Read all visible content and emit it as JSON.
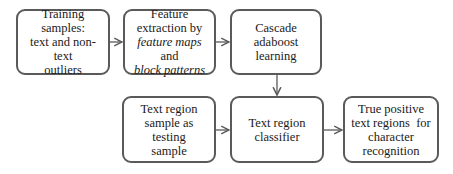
{
  "diagram": {
    "nodes": [
      {
        "id": "training",
        "lines": [
          "Training samples:",
          "text and non-text",
          "outliers"
        ]
      },
      {
        "id": "feature",
        "line1": "Feature",
        "line2": "extraction by",
        "line3_italic": "feature maps",
        "line3_rest": " and",
        "line4_italic": "block patterns"
      },
      {
        "id": "cascade",
        "lines": [
          "Cascade",
          "adaboost",
          "learning"
        ]
      },
      {
        "id": "testing",
        "lines": [
          "Text region",
          "sample as testing",
          "sample"
        ]
      },
      {
        "id": "classifier",
        "lines": [
          "Text region",
          "classifier"
        ]
      },
      {
        "id": "output",
        "lines": [
          "True positive",
          "text regions  for",
          "character",
          "recognition"
        ]
      }
    ],
    "edges": [
      {
        "from": "training",
        "to": "feature"
      },
      {
        "from": "feature",
        "to": "cascade"
      },
      {
        "from": "cascade",
        "to": "classifier"
      },
      {
        "from": "testing",
        "to": "classifier"
      },
      {
        "from": "classifier",
        "to": "output"
      }
    ],
    "colors": {
      "border": "#5a5a5a",
      "arrow": "#5a5a5a",
      "text": "#1a1a1a"
    }
  }
}
